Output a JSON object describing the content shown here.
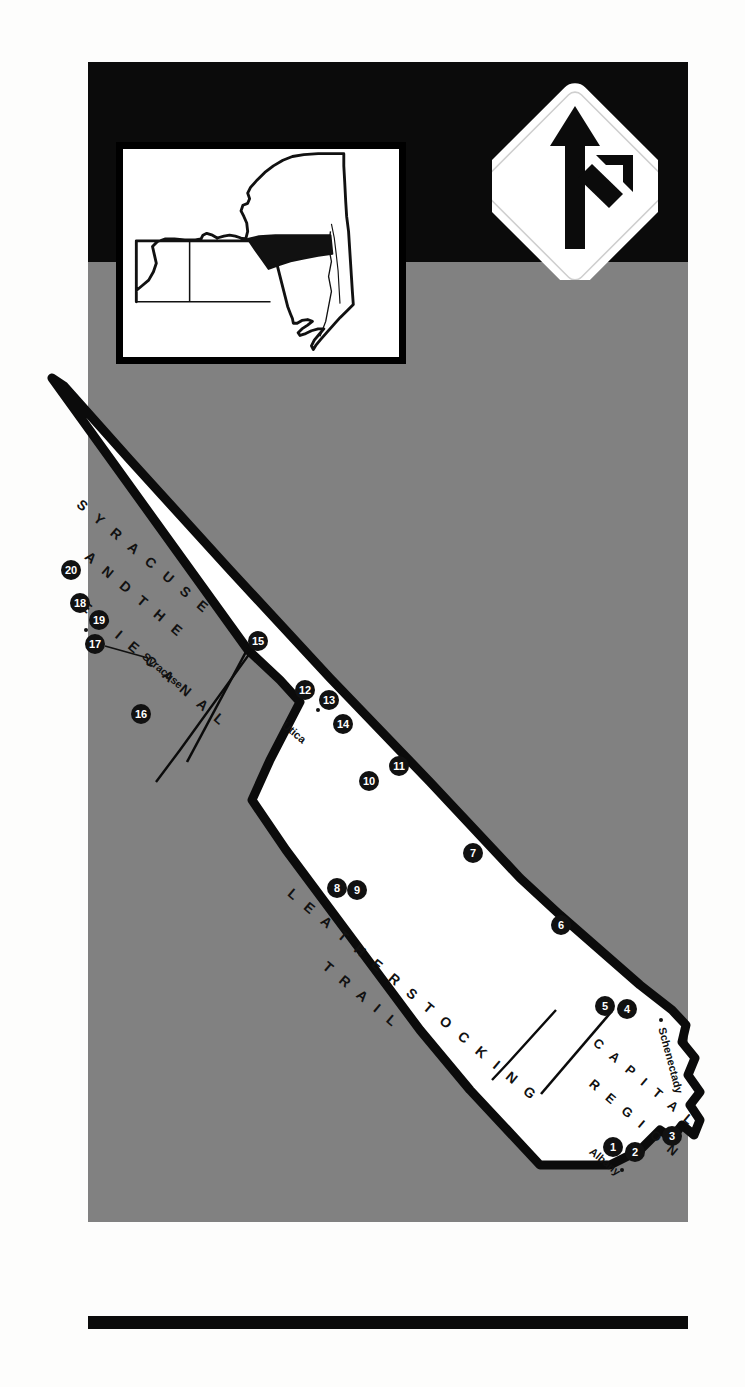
{
  "page": {
    "background_color": "#fdfdfc"
  },
  "header": {
    "black_band_color": "#0b0b0b",
    "gray_band_color": "#818181",
    "inset": {
      "name": "new-york-state-inset",
      "description": "Outline map of New York State with a dark band highlighting the Mohawk Valley corridor"
    },
    "road_sign": {
      "name": "advance-right-turn-sign",
      "shape": "diamond",
      "glyph": "straight-and-right-arrow",
      "border_color": "#ffffff",
      "fill_color": "#ffffff",
      "arrow_color": "#0b0b0b"
    }
  },
  "map": {
    "regions": [
      {
        "id": "syracuse-erie-canal",
        "label": "SYRACUSE AND THE ERIE CANAL",
        "lines": [
          "S Y R A C U S E",
          "A N D   T H E",
          "E R I E   C A N A L"
        ]
      },
      {
        "id": "leatherstocking-trail",
        "label": "LEATHERSTOCKING TRAIL",
        "lines": [
          "L E A T H E R S T O C K I N G",
          "T R A I L"
        ]
      },
      {
        "id": "capital-region",
        "label": "CAPITAL REGION",
        "lines": [
          "C A P I T A L",
          "R E G I O N"
        ]
      }
    ],
    "cities": [
      {
        "name": "Syracuse",
        "label": "Syracuse",
        "region": "syracuse-erie-canal",
        "has_leader_line": true
      },
      {
        "name": "Utica",
        "label": "Utica",
        "region": "leatherstocking-trail",
        "has_leader_line": false
      },
      {
        "name": "Schenectady",
        "label": "Schenectady",
        "region": "capital-region",
        "has_leader_line": false
      },
      {
        "name": "Albany",
        "label": "Albany",
        "region": "capital-region",
        "has_leader_line": false
      }
    ],
    "markers": [
      {
        "number": "1",
        "region": "capital-region",
        "x": 613,
        "y": 1147
      },
      {
        "number": "2",
        "region": "capital-region",
        "x": 635,
        "y": 1152
      },
      {
        "number": "3",
        "region": "capital-region",
        "x": 672,
        "y": 1136
      },
      {
        "number": "4",
        "region": "capital-region",
        "x": 627,
        "y": 1009
      },
      {
        "number": "5",
        "region": "capital-region",
        "x": 605,
        "y": 1006
      },
      {
        "number": "6",
        "region": "leatherstocking-trail",
        "x": 561,
        "y": 925
      },
      {
        "number": "7",
        "region": "leatherstocking-trail",
        "x": 473,
        "y": 853
      },
      {
        "number": "8",
        "region": "leatherstocking-trail",
        "x": 337,
        "y": 888
      },
      {
        "number": "9",
        "region": "leatherstocking-trail",
        "x": 357,
        "y": 890
      },
      {
        "number": "10",
        "region": "leatherstocking-trail",
        "x": 369,
        "y": 781
      },
      {
        "number": "11",
        "region": "leatherstocking-trail",
        "x": 399,
        "y": 766
      },
      {
        "number": "12",
        "region": "leatherstocking-trail",
        "x": 305,
        "y": 690
      },
      {
        "number": "13",
        "region": "leatherstocking-trail",
        "x": 329,
        "y": 700
      },
      {
        "number": "14",
        "region": "leatherstocking-trail",
        "x": 343,
        "y": 724
      },
      {
        "number": "15",
        "region": "syracuse-erie-canal",
        "x": 258,
        "y": 641
      },
      {
        "number": "16",
        "region": "syracuse-erie-canal",
        "x": 141,
        "y": 714
      },
      {
        "number": "17",
        "region": "syracuse-erie-canal",
        "x": 95,
        "y": 644
      },
      {
        "number": "18",
        "region": "syracuse-erie-canal",
        "x": 80,
        "y": 603
      },
      {
        "number": "19",
        "region": "syracuse-erie-canal",
        "x": 99,
        "y": 620
      },
      {
        "number": "20",
        "region": "syracuse-erie-canal",
        "x": 71,
        "y": 570
      }
    ],
    "colors": {
      "land_fill": "#ffffff",
      "surround_fill": "#818181",
      "outline": "#0b0b0b",
      "marker_fill": "#111111",
      "marker_text": "#ffffff"
    }
  },
  "footer": {
    "rule_color": "#0b0b0b"
  }
}
